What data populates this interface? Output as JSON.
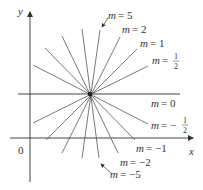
{
  "axes": {
    "x_label": "x",
    "y_label": "y",
    "origin_label": "0"
  },
  "center": {
    "x": 90,
    "y": 94
  },
  "lines": [
    {
      "slope": "5",
      "label": "m = 5"
    },
    {
      "slope": "2",
      "label": "m = 2"
    },
    {
      "slope": "1",
      "label": "m = 1"
    },
    {
      "slope": "1/2",
      "label": "m = 1/2"
    },
    {
      "slope": "0",
      "label": "m = 0"
    },
    {
      "slope": "-1/2",
      "label": "m = -1/2"
    },
    {
      "slope": "-1",
      "label": "m = -1"
    },
    {
      "slope": "-2",
      "label": "m = -2"
    },
    {
      "slope": "-5",
      "label": "m = -5"
    }
  ],
  "labels": {
    "m5": {
      "m": "m",
      "eq": "= 5"
    },
    "m2": {
      "m": "m",
      "eq": "= 2"
    },
    "m1": {
      "m": "m",
      "eq": "= 1"
    },
    "mhalf": {
      "m": "m",
      "eq": "=",
      "num": "1",
      "den": "2"
    },
    "m0": {
      "m": "m",
      "eq": "= 0"
    },
    "mnhalf": {
      "m": "m",
      "eq": "= −",
      "num": "1",
      "den": "2"
    },
    "mn1": {
      "m": "m",
      "eq": "= −1"
    },
    "mn2": {
      "m": "m",
      "eq": "= −2"
    },
    "mn5": {
      "m": "m",
      "eq": "= −5"
    }
  }
}
